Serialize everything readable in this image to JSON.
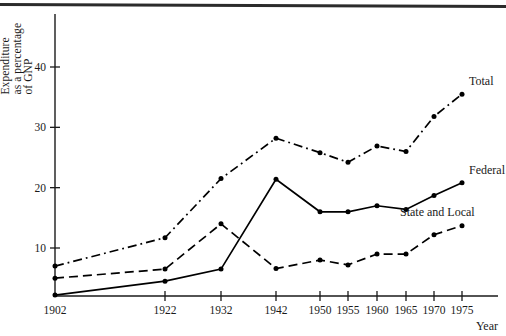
{
  "figure": {
    "ylabel_lines": [
      "Expenditure",
      "as a percentage",
      "of GNP"
    ],
    "xlabel": "Year"
  },
  "chart_data": {
    "type": "line",
    "title": "",
    "xlabel": "Year",
    "ylabel": "Expenditure as a percentage of GNP",
    "categories": [
      "1902",
      "1922",
      "1932",
      "1942",
      "1950",
      "1955",
      "1960",
      "1965",
      "1970",
      "1975"
    ],
    "x_tick_labels": [
      "1902",
      "1922",
      "1932",
      "1942",
      "1950",
      "1955",
      "1960",
      "1965",
      "1970",
      "1975"
    ],
    "y_tick_labels": [
      "10",
      "20",
      "30",
      "40"
    ],
    "y_ticks": [
      10,
      20,
      30,
      40
    ],
    "ylim": [
      0,
      46
    ],
    "grid": false,
    "legend_position": "right-inline",
    "series": [
      {
        "name": "Total",
        "style": "dash-dot",
        "values": [
          7.0,
          11.7,
          21.5,
          28.2,
          25.8,
          24.2,
          26.9,
          26.0,
          31.8,
          35.5
        ]
      },
      {
        "name": "Federal",
        "style": "solid",
        "values": [
          2.2,
          4.5,
          6.5,
          21.4,
          16.0,
          16.0,
          17.0,
          16.4,
          18.7,
          20.8
        ]
      },
      {
        "name": "State and Local",
        "style": "dashed",
        "values": [
          5.0,
          6.5,
          14.0,
          6.6,
          8.0,
          7.2,
          9.0,
          9.0,
          12.2,
          13.7
        ]
      }
    ]
  }
}
